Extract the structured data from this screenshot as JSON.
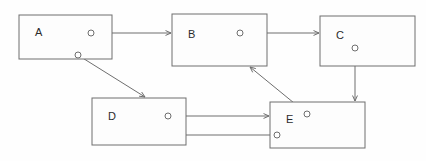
{
  "diagram": {
    "background_color": "#fefefe",
    "stroke_color": "#6e6e6e",
    "label_color": "#2b2b2b",
    "nodes": [
      {
        "id": "A",
        "label": "A",
        "x": 19,
        "y": 15,
        "w": 93,
        "h": 44
      },
      {
        "id": "B",
        "label": "B",
        "x": 172,
        "y": 14,
        "w": 95,
        "h": 52
      },
      {
        "id": "C",
        "label": "C",
        "x": 320,
        "y": 16,
        "w": 95,
        "h": 50
      },
      {
        "id": "D",
        "label": "D",
        "x": 92,
        "y": 98,
        "w": 94,
        "h": 47
      },
      {
        "id": "E",
        "label": "E",
        "x": 270,
        "y": 102,
        "w": 95,
        "h": 46
      }
    ],
    "ports": [
      {
        "id": "port-a-right",
        "node": "A",
        "cx": 91,
        "cy": 33,
        "r": 3
      },
      {
        "id": "port-a-bottom",
        "node": "A",
        "cx": 78,
        "cy": 55,
        "r": 3
      },
      {
        "id": "port-b-right",
        "node": "B",
        "cx": 240,
        "cy": 33,
        "r": 3
      },
      {
        "id": "port-c-bottom",
        "node": "C",
        "cx": 355,
        "cy": 48,
        "r": 3
      },
      {
        "id": "port-d-right",
        "node": "D",
        "cx": 168,
        "cy": 116,
        "r": 3
      },
      {
        "id": "port-e-upper",
        "node": "E",
        "cx": 307,
        "cy": 114,
        "r": 3
      },
      {
        "id": "port-e-left",
        "node": "E",
        "cx": 277,
        "cy": 135,
        "r": 3
      }
    ],
    "edges": [
      {
        "id": "edge-a-to-b",
        "from": "A",
        "to": "B",
        "x1": 94,
        "y1": 33,
        "x2": 171,
        "y2": 33,
        "arrow_at": "end"
      },
      {
        "id": "edge-a-to-d",
        "from": "A",
        "to": "D",
        "x1": 81,
        "y1": 57,
        "x2": 145,
        "y2": 97,
        "arrow_at": "end"
      },
      {
        "id": "edge-b-to-c",
        "from": "B",
        "to": "C",
        "x1": 243,
        "y1": 33,
        "x2": 319,
        "y2": 33,
        "arrow_at": "end"
      },
      {
        "id": "edge-c-to-e",
        "from": "C",
        "to": "E",
        "x1": 355,
        "y1": 51,
        "x2": 355,
        "y2": 101,
        "arrow_at": "end"
      },
      {
        "id": "edge-d-to-e",
        "from": "D",
        "to": "E",
        "x1": 171,
        "y1": 116,
        "x2": 269,
        "y2": 116,
        "arrow_at": "end"
      },
      {
        "id": "edge-e-to-d",
        "from": "E",
        "to": "D",
        "x1": 274,
        "y1": 135,
        "x2": 170,
        "y2": 135,
        "arrow_at": "end"
      },
      {
        "id": "edge-e-to-b",
        "from": "E",
        "to": "B",
        "x1": 305,
        "y1": 112,
        "x2": 250,
        "y2": 67,
        "arrow_at": "end"
      }
    ]
  }
}
